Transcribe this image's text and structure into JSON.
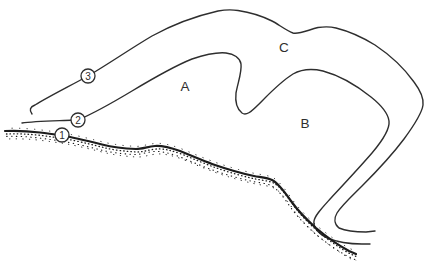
{
  "colors": {
    "paper": "#ffffff",
    "ink": "#2e2e2e",
    "ground_ink": "#1c1c1c"
  },
  "diagram": {
    "region_labels": [
      {
        "text": "A"
      },
      {
        "text": "B"
      },
      {
        "text": "C"
      }
    ],
    "markers": [
      {
        "text": "1"
      },
      {
        "text": "2"
      },
      {
        "text": "3"
      }
    ]
  }
}
